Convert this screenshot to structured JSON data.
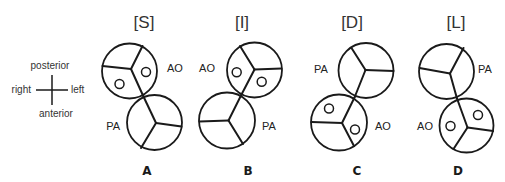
{
  "compass": {
    "top": "posterior",
    "bottom": "anterior",
    "left": "right",
    "right": "left"
  },
  "panels": [
    {
      "id": "A",
      "header": "[S]",
      "letter": "A",
      "vessels": [
        {
          "name": "AO",
          "label": "AO",
          "has_coronary_ostia": true
        },
        {
          "name": "PA",
          "label": "PA",
          "has_coronary_ostia": false
        }
      ]
    },
    {
      "id": "B",
      "header": "[I]",
      "letter": "B",
      "vessels": [
        {
          "name": "AO",
          "label": "AO",
          "has_coronary_ostia": true
        },
        {
          "name": "PA",
          "label": "PA",
          "has_coronary_ostia": false
        }
      ]
    },
    {
      "id": "C",
      "header": "[D]",
      "letter": "C",
      "vessels": [
        {
          "name": "PA",
          "label": "PA",
          "has_coronary_ostia": false
        },
        {
          "name": "AO",
          "label": "AO",
          "has_coronary_ostia": true
        }
      ]
    },
    {
      "id": "D",
      "header": "[L]",
      "letter": "D",
      "vessels": [
        {
          "name": "PA",
          "label": "PA",
          "has_coronary_ostia": false
        },
        {
          "name": "AO",
          "label": "AO",
          "has_coronary_ostia": true
        }
      ]
    }
  ],
  "colors": {
    "line": "#1a1a1a",
    "text": "#222222",
    "background": "#ffffff"
  }
}
